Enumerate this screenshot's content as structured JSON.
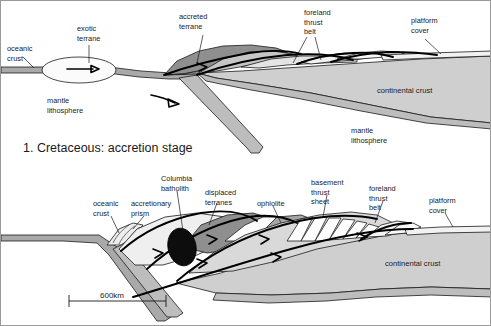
{
  "figure": {
    "width": 491,
    "height": 326,
    "background": "#ffffff",
    "border_color": "#9a9a9a"
  },
  "colors": {
    "oceanic_crust": "#a9a9a9",
    "continental_crust": "#cfcfcf",
    "mantle_lithosphere": "#bdbdbd",
    "accreted_terrane_dark": "#8f8f8f",
    "displaced_terrane": "#8f8f8f",
    "ophiolite": "#a5a5a5",
    "platform_cover": "#f2f2f2",
    "accretionary_prism": "#e8e8e8",
    "batholith": "#0d0d0d",
    "thrust_sheet": "#ffffff",
    "outline": "#1a1a1a",
    "thrust_fault": "#000000"
  },
  "panels": [
    {
      "id": "panel-1",
      "stage_label": "1. Cretaceous: accretion stage",
      "labels": [
        {
          "name": "oceanic-crust",
          "lines": [
            "oceanic",
            "crust"
          ],
          "x": 6,
          "y": 44
        },
        {
          "name": "exotic-terrane",
          "lines": [
            "exotic",
            "terrane"
          ],
          "x": 78,
          "y": 30
        },
        {
          "name": "mantle-lithosphere-left",
          "lines": [
            "mantle",
            "lithosphere"
          ],
          "x": 46,
          "y": 100
        },
        {
          "name": "accreted-terrane",
          "lines": [
            "accreted",
            "terrane"
          ],
          "x": 178,
          "y": 14
        },
        {
          "name": "foreland-thrust-belt",
          "lines": [
            "foreland",
            "thrust",
            "belt"
          ],
          "x": 303,
          "y": 11
        },
        {
          "name": "platform-cover",
          "lines": [
            "platform",
            "cover"
          ],
          "x": 410,
          "y": 18
        },
        {
          "name": "continental-crust",
          "lines": [
            "continental crust"
          ],
          "x": 380,
          "y": 89
        },
        {
          "name": "mantle-lithosphere-right",
          "lines": [
            "mantle",
            "lithosphere"
          ],
          "x": 350,
          "y": 128
        }
      ]
    },
    {
      "id": "panel-2",
      "stage_label": "",
      "scale_bar": {
        "value": "600km",
        "x1": 68,
        "x2": 165,
        "y": 299
      },
      "labels": [
        {
          "name": "oceanic-crust",
          "lines": [
            "oceanic",
            "crust"
          ],
          "x": 95,
          "y": 202
        },
        {
          "name": "accretionary-prism",
          "lines": [
            "accretionary",
            "prism"
          ],
          "x": 133,
          "y": 202
        },
        {
          "name": "columbia-batholith",
          "lines": [
            "Columbia",
            "batholith"
          ],
          "x": 162,
          "y": 176
        },
        {
          "name": "displaced-terranes",
          "lines": [
            "displaced",
            "terranes"
          ],
          "x": 205,
          "y": 190
        },
        {
          "name": "ophiolite",
          "lines": [
            "ophiolite"
          ],
          "x": 259,
          "y": 202
        },
        {
          "name": "basement-thrust-sheet",
          "lines": [
            "basement",
            "thrust",
            "sheet"
          ],
          "x": 312,
          "y": 180
        },
        {
          "name": "foreland-thrust-belt",
          "lines": [
            "foreland",
            "thrust",
            "belt"
          ],
          "x": 370,
          "y": 186
        },
        {
          "name": "platform-cover",
          "lines": [
            "platform",
            "cover"
          ],
          "x": 430,
          "y": 198
        },
        {
          "name": "continental-crust",
          "lines": [
            "continental crust"
          ],
          "x": 388,
          "y": 262
        }
      ]
    }
  ],
  "legend_terms": [
    "oceanic crust",
    "exotic terrane",
    "mantle lithosphere",
    "accreted terrane",
    "foreland thrust belt",
    "platform cover",
    "continental crust",
    "accretionary prism",
    "Columbia batholith",
    "displaced terranes",
    "ophiolite",
    "basement thrust sheet"
  ]
}
